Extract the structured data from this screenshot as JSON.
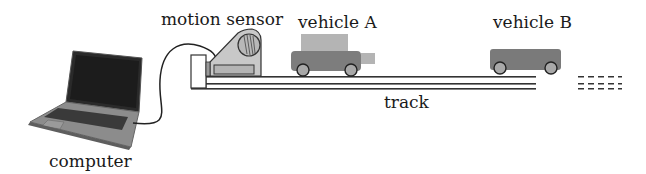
{
  "diagram": {
    "type": "physics-apparatus",
    "labels": {
      "motion_sensor": "motion sensor",
      "vehicle_a": "vehicle A",
      "vehicle_b": "vehicle B",
      "track": "track",
      "computer": "computer"
    },
    "components": [
      {
        "id": "computer",
        "icon": "laptop-icon"
      },
      {
        "id": "cable",
        "icon": "cable-icon",
        "connects": [
          "computer",
          "motion_sensor"
        ]
      },
      {
        "id": "motion_sensor",
        "icon": "motion-sensor-icon"
      },
      {
        "id": "vehicle_a",
        "icon": "car-icon",
        "position": "left"
      },
      {
        "id": "vehicle_b",
        "icon": "cart-icon",
        "position": "right"
      },
      {
        "id": "track",
        "icon": "track-icon",
        "continues": "right (dashed)"
      }
    ],
    "colors": {
      "sensor_fill": "#c8c8c8",
      "vehicle_a_body": "#7d7d7d",
      "vehicle_a_cab": "#b4b4b4",
      "vehicle_b_body": "#7a7a7a",
      "wheel": "#a8a8a8",
      "line": "#333333",
      "laptop_screen": "#1c1c1c",
      "laptop_body": "#8a8a8a"
    }
  }
}
